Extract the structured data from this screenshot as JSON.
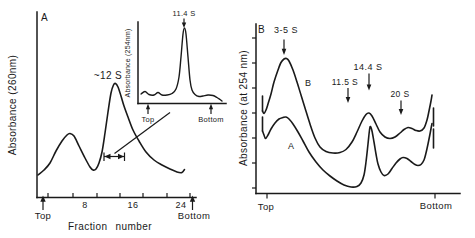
{
  "figure": {
    "bg": "#ffffff",
    "ink": "#1a1a1a",
    "panel_a": {
      "panel_label": "A",
      "y_axis_label": "Absorbance (260nm)",
      "x_axis_label": "Fraction number",
      "x_tick_labels": [
        "8",
        "16",
        "24"
      ],
      "left_end_label": "Top",
      "right_end_label": "Bottom",
      "peak_annotation": "~12 S",
      "inset": {
        "y_axis_label": "Absorbance (254nm)",
        "peak_annotation": "11.4 S",
        "left_end_label": "Top",
        "right_end_label": "Bottom"
      }
    },
    "panel_b": {
      "panel_label": "B",
      "y_axis_label": "Absorbance (at 254 nm)",
      "left_end_label": "Top",
      "right_end_label": "Bottom",
      "annotations": {
        "a1": "3-5 S",
        "a2": "11.5 S",
        "a3": "14.4 S",
        "a4": "20 S"
      },
      "curve_upper_label": "B",
      "curve_lower_label": "A"
    }
  },
  "chart_data": [
    {
      "id": "panel-a-main",
      "type": "line",
      "title": "Panel A gradient profile",
      "xlabel": "Fraction number",
      "ylabel": "Absorbance (260nm)",
      "x_ticks": [
        8,
        16,
        24
      ],
      "x_range_labels": [
        "Top",
        "Bottom"
      ],
      "annotations": [
        {
          "label": "~12 S",
          "at": "main peak, fraction ~13"
        }
      ],
      "peaks": [
        {
          "fraction": 6,
          "rel_absorbance": 0.35,
          "note": "minor peak"
        },
        {
          "fraction": 13,
          "rel_absorbance": 0.62,
          "note": "main peak, ~12 S"
        }
      ],
      "profile_estimate": [
        [
          0.5,
          0.12
        ],
        [
          2,
          0.16
        ],
        [
          4,
          0.27
        ],
        [
          6,
          0.35
        ],
        [
          8,
          0.2
        ],
        [
          9.5,
          0.15
        ],
        [
          11,
          0.3
        ],
        [
          12,
          0.5
        ],
        [
          13,
          0.62
        ],
        [
          14,
          0.55
        ],
        [
          15,
          0.44
        ],
        [
          17,
          0.33
        ],
        [
          19,
          0.23
        ],
        [
          21,
          0.17
        ],
        [
          23,
          0.14
        ],
        [
          25,
          0.14
        ]
      ],
      "series": [
        {
          "name": "A260",
          "px": [
            [
              38,
              175
            ],
            [
              44,
              170
            ],
            [
              50,
              163
            ],
            [
              56,
              151
            ],
            [
              62,
              141
            ],
            [
              67,
              135
            ],
            [
              70,
              133.5
            ],
            [
              74,
              136
            ],
            [
              79,
              146
            ],
            [
              85,
              158
            ],
            [
              90,
              167
            ],
            [
              93,
              170
            ],
            [
              96,
              169
            ],
            [
              99,
              163
            ],
            [
              102,
              152
            ],
            [
              105,
              133
            ],
            [
              108,
              112
            ],
            [
              111,
              93
            ],
            [
              113.5,
              85
            ],
            [
              115.5,
              83.5
            ],
            [
              118,
              87
            ],
            [
              121,
              96
            ],
            [
              124,
              106
            ],
            [
              128,
              117
            ],
            [
              133,
              130
            ],
            [
              139,
              141
            ],
            [
              146,
              152
            ],
            [
              154,
              160
            ],
            [
              162,
              165
            ],
            [
              170,
              169
            ],
            [
              177,
              172
            ],
            [
              182,
              172.5
            ],
            [
              184.5,
              169.5
            ]
          ]
        }
      ]
    },
    {
      "id": "panel-a-inset",
      "type": "line",
      "title": "Panel A inset re-run of pooled peak fractions",
      "ylabel": "Absorbance (254nm)",
      "x_range_labels": [
        "Top",
        "Bottom"
      ],
      "annotations": [
        {
          "label": "11.4 S",
          "at": "sharp peak"
        }
      ],
      "peaks": [
        {
          "position": 0.55,
          "rel_absorbance": 0.92,
          "note": "11.4 S sharp peak"
        }
      ],
      "profile_estimate": [
        [
          0,
          0.12
        ],
        [
          0.1,
          0.15
        ],
        [
          0.2,
          0.1
        ],
        [
          0.3,
          0.11
        ],
        [
          0.4,
          0.13
        ],
        [
          0.47,
          0.3
        ],
        [
          0.52,
          0.75
        ],
        [
          0.55,
          0.92
        ],
        [
          0.58,
          0.7
        ],
        [
          0.63,
          0.22
        ],
        [
          0.7,
          0.09
        ],
        [
          0.8,
          0.1
        ],
        [
          0.9,
          0.08
        ],
        [
          1,
          0.03
        ]
      ],
      "series": [
        {
          "name": "A254",
          "px": [
            [
              141,
              94
            ],
            [
              145,
              91.5
            ],
            [
              149,
              94.5
            ],
            [
              154,
              95
            ],
            [
              158,
              92.5
            ],
            [
              162,
              95
            ],
            [
              167,
              95
            ],
            [
              172,
              93.5
            ],
            [
              176,
              89
            ],
            [
              179,
              77
            ],
            [
              181,
              57
            ],
            [
              183,
              34
            ],
            [
              184.5,
              28
            ],
            [
              186,
              34
            ],
            [
              188,
              57
            ],
            [
              190,
              80
            ],
            [
              192,
              90
            ],
            [
              195,
              94.5
            ],
            [
              199,
              96.5
            ],
            [
              203,
              96
            ],
            [
              208,
              95
            ],
            [
              213,
              95.5
            ],
            [
              217,
              97.5
            ],
            [
              220,
              99.5
            ],
            [
              222,
              101
            ]
          ]
        }
      ]
    },
    {
      "id": "panel-b",
      "type": "line",
      "title": "Panel B gradient profiles, curves A and B",
      "ylabel": "Absorbance (at 254 nm)",
      "x_range_labels": [
        "Top",
        "Bottom"
      ],
      "annotations": [
        {
          "label": "3-5 S",
          "position": 0.11
        },
        {
          "label": "11.5 S",
          "position": 0.48
        },
        {
          "label": "14.4 S",
          "position": 0.61
        },
        {
          "label": "20 S",
          "position": 0.8
        }
      ],
      "series": [
        {
          "name": "B (upper)",
          "profile_estimate": [
            [
              0,
              0.55
            ],
            [
              0.03,
              0.49
            ],
            [
              0.11,
              0.79
            ],
            [
              0.2,
              0.42
            ],
            [
              0.3,
              0.25
            ],
            [
              0.42,
              0.25
            ],
            [
              0.52,
              0.39
            ],
            [
              0.61,
              0.47
            ],
            [
              0.71,
              0.33
            ],
            [
              0.83,
              0.39
            ],
            [
              0.92,
              0.37
            ],
            [
              0.98,
              0.58
            ]
          ],
          "px": [
            [
              262.5,
              111
            ],
            [
              264,
              113.5
            ],
            [
              266,
              110
            ],
            [
              268,
              104
            ],
            [
              271,
              94
            ],
            [
              274,
              82
            ],
            [
              278,
              70
            ],
            [
              281,
              62.5
            ],
            [
              284,
              59
            ],
            [
              286.5,
              58.5
            ],
            [
              289,
              61
            ],
            [
              293,
              70
            ],
            [
              297,
              82
            ],
            [
              301,
              95
            ],
            [
              305,
              108
            ],
            [
              310,
              124
            ],
            [
              315,
              138
            ],
            [
              320,
              147
            ],
            [
              326,
              151.5
            ],
            [
              333,
              153
            ],
            [
              340,
              152.5
            ],
            [
              346,
              149.5
            ],
            [
              352,
              142
            ],
            [
              357,
              132
            ],
            [
              362,
              121
            ],
            [
              366,
              114.5
            ],
            [
              369,
              113
            ],
            [
              372,
              116
            ],
            [
              376,
              124
            ],
            [
              380,
              132
            ],
            [
              385,
              137
            ],
            [
              390,
              138.5
            ],
            [
              395,
              137
            ],
            [
              400,
              133
            ],
            [
              404,
              129.5
            ],
            [
              408,
              127.5
            ],
            [
              412,
              128.5
            ],
            [
              416,
              130.5
            ],
            [
              420,
              131
            ],
            [
              424,
              128
            ],
            [
              427,
              120
            ],
            [
              429,
              111
            ],
            [
              431,
              101
            ],
            [
              432,
              95
            ]
          ]
        },
        {
          "name": "A (lower)",
          "profile_estimate": [
            [
              0,
              0.45
            ],
            [
              0.03,
              0.33
            ],
            [
              0.11,
              0.45
            ],
            [
              0.25,
              0.19
            ],
            [
              0.4,
              0.05
            ],
            [
              0.52,
              0.07
            ],
            [
              0.6,
              0.39
            ],
            [
              0.67,
              0.11
            ],
            [
              0.8,
              0.21
            ],
            [
              0.9,
              0.18
            ],
            [
              0.98,
              0.41
            ]
          ],
          "px": [
            [
              262.5,
              131
            ],
            [
              264,
              135
            ],
            [
              265.5,
              138.5
            ],
            [
              268,
              135
            ],
            [
              271,
              129
            ],
            [
              275,
              123
            ],
            [
              279,
              119
            ],
            [
              283,
              117.5
            ],
            [
              286,
              117
            ],
            [
              289,
              119
            ],
            [
              293,
              124
            ],
            [
              298,
              132
            ],
            [
              303,
              141
            ],
            [
              309,
              152
            ],
            [
              316,
              162
            ],
            [
              323,
              170
            ],
            [
              330,
              176
            ],
            [
              337,
              181
            ],
            [
              344,
              185
            ],
            [
              351,
              187
            ],
            [
              357,
              186.5
            ],
            [
              361,
              183
            ],
            [
              364,
              175
            ],
            [
              366,
              162
            ],
            [
              368,
              144
            ],
            [
              369.5,
              130
            ],
            [
              370.5,
              126.5
            ],
            [
              372,
              131
            ],
            [
              374,
              142
            ],
            [
              376,
              154
            ],
            [
              378,
              164
            ],
            [
              381,
              172
            ],
            [
              384,
              175.5
            ],
            [
              388,
              174
            ],
            [
              392,
              168.5
            ],
            [
              396,
              163
            ],
            [
              400,
              159
            ],
            [
              403,
              157.5
            ],
            [
              407,
              158.5
            ],
            [
              411,
              161.5
            ],
            [
              415,
              164.5
            ],
            [
              418,
              165.5
            ],
            [
              421,
              164.5
            ],
            [
              424,
              160
            ],
            [
              426,
              153
            ],
            [
              428,
              144
            ],
            [
              430,
              134
            ],
            [
              431.5,
              126
            ],
            [
              432,
              123.5
            ]
          ]
        }
      ]
    }
  ]
}
